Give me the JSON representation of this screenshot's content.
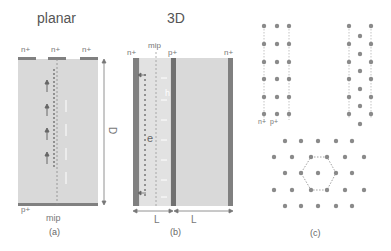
{
  "panel_a": {
    "title": "planar",
    "top_labels": [
      "n+",
      "n+",
      "n+"
    ],
    "bottom_label": "p+",
    "mip_label": "mip",
    "hole_label": "h",
    "electron_label": "e",
    "thickness_label": "D",
    "caption": "(a)"
  },
  "panel_b": {
    "title": "3D",
    "mip_label": "mip",
    "top_labels": [
      "n+",
      "p+",
      "n+"
    ],
    "hole_label": "h",
    "electron_label": "e",
    "spacing_labels": [
      "L",
      "L"
    ],
    "caption": "(b)"
  },
  "panel_c": {
    "electrode_labels": [
      "n+",
      "p+"
    ],
    "caption": "(c)"
  },
  "colors": {
    "substrate": "#d9d9d9",
    "electrode": "#808080",
    "dot": "#8a8a8a",
    "line": "#888888"
  }
}
